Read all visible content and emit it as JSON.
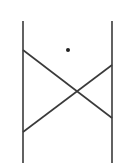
{
  "diagram": {
    "background": "#ffffff",
    "stroke_color": "#3a3a3a",
    "stroke_width": 1.6,
    "verticals": [
      {
        "x": 23,
        "y1": 21,
        "y2": 163
      },
      {
        "x": 112,
        "y1": 21,
        "y2": 163
      }
    ],
    "diagonals": [
      {
        "x1": 23,
        "y1": 50,
        "x2": 112,
        "y2": 118
      },
      {
        "x1": 23,
        "y1": 132,
        "x2": 112,
        "y2": 65
      }
    ],
    "dot": {
      "cx": 68,
      "cy": 50,
      "r": 2
    }
  }
}
